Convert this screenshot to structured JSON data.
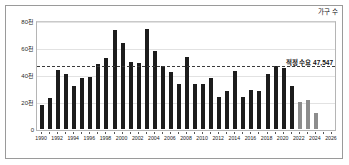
{
  "chart_data": {
    "type": "bar",
    "title": "",
    "subtitle": "",
    "xlabel": "",
    "ylabel": "",
    "unit_note": "가구 수",
    "ylim": [
      0,
      80000
    ],
    "yticks": [
      0,
      20000,
      40000,
      60000,
      80000
    ],
    "ytick_labels": [
      "0",
      "20천",
      "40천",
      "60천",
      "80천"
    ],
    "grid": true,
    "legend_position": "none",
    "xlim": [
      1989.3,
      2026.7
    ],
    "xtick_labels": [
      "1990",
      "1992",
      "1994",
      "1996",
      "1998",
      "2000",
      "2002",
      "2004",
      "2006",
      "2008",
      "2010",
      "2012",
      "2014",
      "2016",
      "2018",
      "2020",
      "2022",
      "2024",
      "2026"
    ],
    "annotations": [
      {
        "name": "optimal-demand",
        "label": "적정 수요 47,547",
        "value": 47547,
        "style": "dashed-horizontal-line"
      }
    ],
    "categories": [
      "1990",
      "1991",
      "1992",
      "1993",
      "1994",
      "1995",
      "1996",
      "1997",
      "1998",
      "1999",
      "2000",
      "2001",
      "2002",
      "2003",
      "2004",
      "2005",
      "2006",
      "2007",
      "2008",
      "2009",
      "2010",
      "2011",
      "2012",
      "2013",
      "2014",
      "2015",
      "2016",
      "2017",
      "2018",
      "2019",
      "2020",
      "2021",
      "2022",
      "2023",
      "2024",
      "2025",
      "2026"
    ],
    "values": [
      18000,
      23000,
      43500,
      41000,
      32000,
      37500,
      38500,
      48000,
      52500,
      73000,
      63500,
      50000,
      49000,
      74000,
      58000,
      47000,
      42000,
      33500,
      53500,
      33000,
      33000,
      37500,
      23500,
      28000,
      43000,
      24000,
      29000,
      28500,
      40500,
      47000,
      45000,
      31500,
      20000,
      21500,
      11500,
      0,
      0
    ],
    "series_styles": [
      {
        "name": "actual",
        "color": "#1c1c1c",
        "years": [
          "1990",
          "1991",
          "1992",
          "1993",
          "1994",
          "1995",
          "1996",
          "1997",
          "1998",
          "1999",
          "2000",
          "2001",
          "2002",
          "2003",
          "2004",
          "2005",
          "2006",
          "2007",
          "2008",
          "2009",
          "2010",
          "2011",
          "2012",
          "2013",
          "2014",
          "2015",
          "2016",
          "2017",
          "2018",
          "2019",
          "2020",
          "2021"
        ]
      },
      {
        "name": "forecast",
        "color": "#8d8d8d",
        "years": [
          "2022",
          "2023",
          "2024",
          "2025",
          "2026"
        ]
      }
    ]
  }
}
